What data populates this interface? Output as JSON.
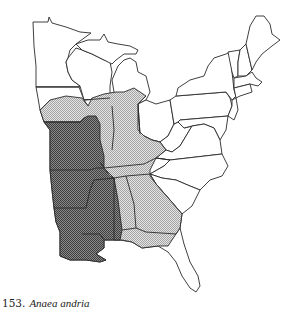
{
  "figure": {
    "number": "153.",
    "species_name": "Anaea andria",
    "region": "Eastern United States",
    "legend": {
      "dark_shading": "core range",
      "light_shading": "peripheral range"
    },
    "colors": {
      "outline": "#2a2a2a",
      "dark_stipple": "#6e6e6e",
      "light_stipple": "#c2c2c2",
      "background": "#ffffff"
    }
  }
}
